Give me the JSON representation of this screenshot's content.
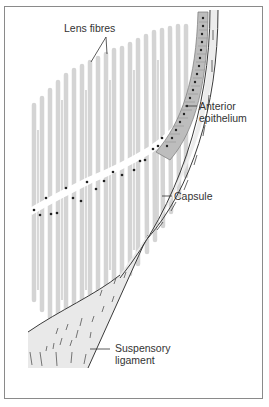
{
  "figure": {
    "type": "anatomical-diagram",
    "labels": [
      {
        "id": "lens-fibres",
        "text": "Lens fibres"
      },
      {
        "id": "anterior-epithelium",
        "line1": "Anterior",
        "line2": "epithelium"
      },
      {
        "id": "capsule",
        "text": "Capsule"
      },
      {
        "id": "suspensory-ligament",
        "line1": "Suspensory",
        "line2": "ligament"
      }
    ],
    "colors": {
      "fibre": "#d4d4d4",
      "capsule_fill": "#ececec",
      "epithelium_fill": "#bdbdbd",
      "ligament_fill": "#e9e9e9",
      "outline": "#3a3a3a",
      "nucleus": "#222222",
      "frame": "#8a8a8a",
      "text": "#333333"
    }
  }
}
